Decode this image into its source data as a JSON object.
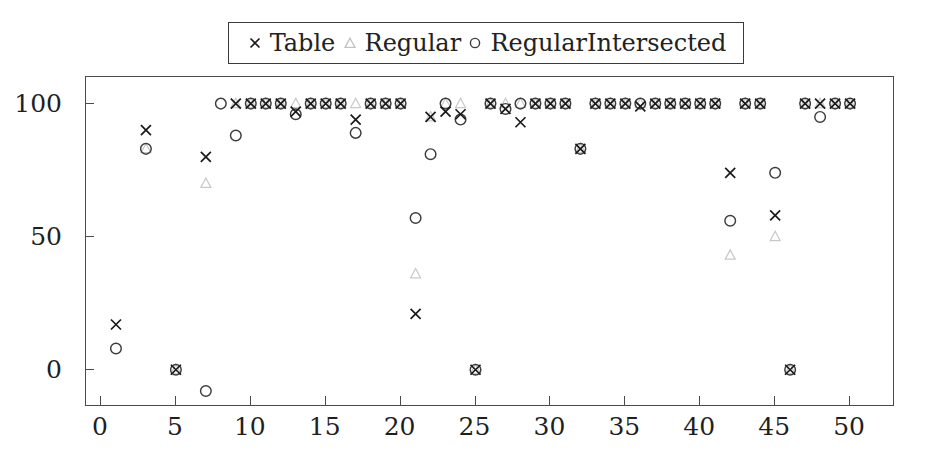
{
  "chart_data": {
    "type": "scatter",
    "title": "",
    "xlabel": "",
    "ylabel": "",
    "xlim": [
      -1,
      53
    ],
    "ylim": [
      -14,
      110
    ],
    "grid": false,
    "legend_position": "top-center",
    "xticks": [
      0,
      5,
      10,
      15,
      20,
      25,
      30,
      35,
      40,
      45,
      50
    ],
    "yticks": [
      0,
      50,
      100
    ],
    "series": [
      {
        "name": "Table",
        "marker": "x",
        "color": "#1a1a1a",
        "x": [
          1,
          3,
          5,
          7,
          9,
          10,
          11,
          12,
          13,
          14,
          15,
          16,
          17,
          18,
          19,
          20,
          21,
          22,
          23,
          24,
          25,
          26,
          27,
          28,
          29,
          30,
          31,
          32,
          33,
          34,
          35,
          36,
          37,
          38,
          39,
          40,
          41,
          42,
          43,
          44,
          45,
          46,
          47,
          48,
          49,
          50
        ],
        "values": [
          17,
          90,
          0,
          80,
          100,
          100,
          100,
          100,
          97,
          100,
          100,
          100,
          94,
          100,
          100,
          100,
          21,
          95,
          97,
          96,
          0,
          100,
          98,
          93,
          100,
          100,
          100,
          83,
          100,
          100,
          100,
          99,
          100,
          100,
          100,
          100,
          100,
          74,
          100,
          100,
          58,
          0,
          100,
          100,
          100,
          100
        ]
      },
      {
        "name": "Regular",
        "marker": "triangle",
        "color": "#c9c9c9",
        "x": [
          3,
          5,
          7,
          9,
          10,
          11,
          12,
          13,
          14,
          15,
          16,
          17,
          18,
          19,
          20,
          21,
          22,
          23,
          24,
          25,
          26,
          27,
          28,
          29,
          30,
          31,
          32,
          33,
          34,
          35,
          36,
          37,
          38,
          39,
          40,
          41,
          42,
          43,
          44,
          45,
          46,
          47,
          48,
          49,
          50
        ],
        "values": [
          83,
          0,
          70,
          100,
          100,
          100,
          100,
          100,
          100,
          100,
          100,
          100,
          100,
          100,
          100,
          36,
          95,
          100,
          100,
          0,
          100,
          100,
          100,
          100,
          100,
          100,
          83,
          100,
          100,
          100,
          100,
          100,
          100,
          100,
          100,
          100,
          43,
          100,
          100,
          50,
          0,
          100,
          100,
          100,
          100
        ]
      },
      {
        "name": "RegularIntersected",
        "marker": "circle",
        "color": "#3c3c3c",
        "x": [
          1,
          3,
          5,
          7,
          8,
          9,
          10,
          11,
          12,
          13,
          14,
          15,
          16,
          17,
          18,
          19,
          20,
          21,
          22,
          23,
          24,
          25,
          26,
          27,
          28,
          29,
          30,
          31,
          32,
          33,
          34,
          35,
          36,
          37,
          38,
          39,
          40,
          41,
          42,
          43,
          44,
          45,
          46,
          47,
          48,
          49,
          50
        ],
        "values": [
          8,
          83,
          0,
          -8,
          100,
          88,
          100,
          100,
          100,
          96,
          100,
          100,
          100,
          89,
          100,
          100,
          100,
          57,
          81,
          100,
          94,
          0,
          100,
          98,
          100,
          100,
          100,
          100,
          83,
          100,
          100,
          100,
          100,
          100,
          100,
          100,
          100,
          100,
          56,
          100,
          100,
          74,
          0,
          100,
          95,
          100,
          100
        ]
      }
    ]
  },
  "legend": {
    "entries": [
      {
        "label": "Table",
        "marker": "x-marker-icon"
      },
      {
        "label": "Regular",
        "marker": "triangle-marker-icon"
      },
      {
        "label": "RegularIntersected",
        "marker": "circle-marker-icon"
      }
    ]
  },
  "axes": {
    "x_tick_labels": [
      "0",
      "5",
      "10",
      "15",
      "20",
      "25",
      "30",
      "35",
      "40",
      "45",
      "50"
    ],
    "y_tick_labels": [
      "0",
      "50",
      "100"
    ]
  }
}
